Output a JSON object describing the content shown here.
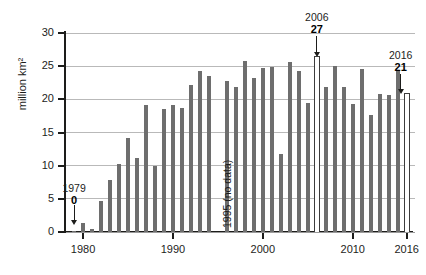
{
  "chart_data": {
    "type": "bar",
    "title": "",
    "xlabel": "",
    "ylabel": "million km²",
    "ylim": [
      0,
      30
    ],
    "xlim": [
      1979,
      2016
    ],
    "ytick_labels": [
      "0",
      "5",
      "10",
      "15",
      "20",
      "25",
      "30"
    ],
    "ytick_values": [
      0,
      5,
      10,
      15,
      20,
      25,
      30
    ],
    "xtick_labels": [
      "1980",
      "1990",
      "2000",
      "2010",
      "2016"
    ],
    "xtick_values": [
      1980,
      1990,
      2000,
      2010,
      2016
    ],
    "grid": "horizontal",
    "legend": "none",
    "bar_color": "#6e6e6e",
    "highlight_color": "#ffffff",
    "highlight_border": "#3c3c3c",
    "categories": [
      1979,
      1980,
      1981,
      1982,
      1983,
      1984,
      1985,
      1986,
      1987,
      1988,
      1989,
      1990,
      1991,
      1992,
      1993,
      1994,
      1995,
      1996,
      1997,
      1998,
      1999,
      2000,
      2001,
      2002,
      2003,
      2004,
      2005,
      2006,
      2007,
      2008,
      2009,
      2010,
      2011,
      2012,
      2013,
      2014,
      2015,
      2016
    ],
    "values": [
      0.1,
      1.3,
      0.5,
      4.7,
      7.9,
      10.2,
      14.1,
      11.2,
      19.2,
      9.9,
      18.6,
      19.1,
      18.7,
      22.2,
      24.2,
      23.5,
      null,
      22.8,
      21.9,
      25.8,
      23.2,
      24.7,
      24.9,
      11.8,
      25.7,
      24.3,
      19.4,
      26.5,
      21.9,
      25.0,
      21.9,
      19.3,
      24.5,
      17.7,
      20.8,
      20.7,
      24.4,
      21.0
    ],
    "missing_note": "1995 (no data)",
    "annotations": [
      {
        "year": 1979,
        "year_label": "1979",
        "value_label": "0",
        "value": 0.1
      },
      {
        "year": 2006,
        "year_label": "2006",
        "value_label": "27",
        "value": 26.5
      },
      {
        "year": 2016,
        "year_label": "2016",
        "value_label": "21",
        "value": 21.0
      }
    ],
    "highlighted": [
      2006,
      2016
    ]
  }
}
